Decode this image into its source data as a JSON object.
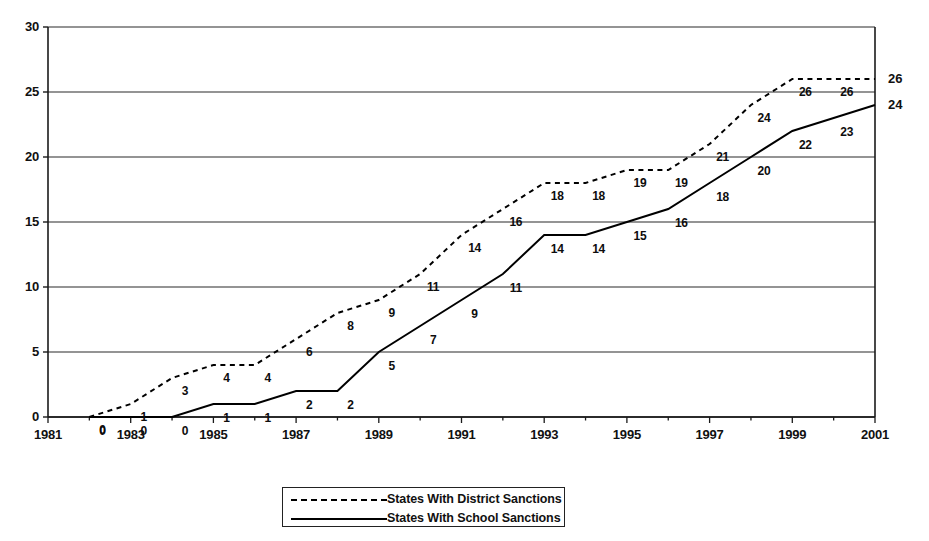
{
  "chart_data": {
    "type": "line",
    "title": "",
    "subtitle": "",
    "xlabel": "",
    "ylabel": "",
    "xlim": [
      1981,
      2001
    ],
    "ylim": [
      0,
      30
    ],
    "yticks": [
      0,
      5,
      10,
      15,
      20,
      25,
      30
    ],
    "xticks": [
      1981,
      1983,
      1985,
      1987,
      1989,
      1991,
      1993,
      1995,
      1997,
      1999,
      2001
    ],
    "x_tick_labels": [
      "1981",
      "1983",
      "1985",
      "1987",
      "1989",
      "1991",
      "1993",
      "1995",
      "1997",
      "1999",
      "2001"
    ],
    "y_tick_labels": [
      "0",
      "5",
      "10",
      "15",
      "20",
      "25",
      "30"
    ],
    "grid": true,
    "grid_axis": "y",
    "legend_position": "bottom",
    "x": [
      1982,
      1983,
      1984,
      1985,
      1986,
      1987,
      1988,
      1989,
      1990,
      1991,
      1992,
      1993,
      1994,
      1995,
      1996,
      1997,
      1998,
      1999,
      2000,
      2001
    ],
    "series": [
      {
        "name": "States With District Sanctions",
        "style": "dashed",
        "color": "#000000",
        "values": [
          0,
          1,
          3,
          4,
          4,
          6,
          8,
          9,
          11,
          14,
          16,
          18,
          18,
          19,
          19,
          21,
          24,
          26,
          26,
          26
        ],
        "labels": [
          "0",
          "1",
          "3",
          "4",
          "4",
          "6",
          "8",
          "9",
          "11",
          "14",
          "16",
          "18",
          "18",
          "19",
          "19",
          "21",
          "24",
          "26",
          "26",
          "26"
        ]
      },
      {
        "name": "States With School Sanctions",
        "style": "solid",
        "color": "#000000",
        "values": [
          0,
          0,
          0,
          1,
          1,
          2,
          2,
          5,
          7,
          9,
          11,
          14,
          14,
          15,
          16,
          18,
          20,
          22,
          23,
          24
        ],
        "labels": [
          "0",
          "0",
          "0",
          "1",
          "1",
          "2",
          "2",
          "5",
          "7",
          "9",
          "11",
          "14",
          "14",
          "15",
          "16",
          "18",
          "20",
          "22",
          "23",
          "24"
        ]
      }
    ],
    "edge_labels": [
      {
        "text": "26",
        "value": 26,
        "series": "States With District Sanctions"
      },
      {
        "text": "24",
        "value": 24,
        "series": "States With School Sanctions"
      }
    ]
  },
  "legend": {
    "items": [
      {
        "label": "States With District Sanctions",
        "style": "dashed"
      },
      {
        "label": "States With School Sanctions",
        "style": "solid"
      }
    ]
  }
}
